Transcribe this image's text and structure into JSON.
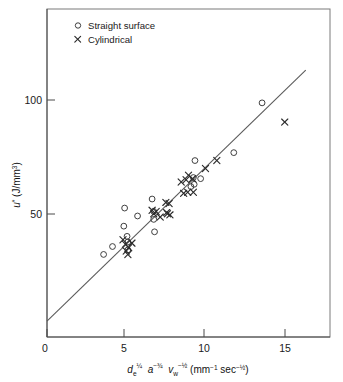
{
  "chart_data": {
    "type": "scatter",
    "title": "",
    "xlabel": "de^1/4 a^-3/4 vw^-1/2 (mm^-1 sec^-1/2)",
    "ylabel": "u* (J/mm3)",
    "xlim": [
      0,
      17.5
    ],
    "ylim": [
      0,
      145
    ],
    "xticks": [
      0,
      5,
      10,
      15
    ],
    "xticklabels": [
      "0",
      "5",
      "10",
      "15"
    ],
    "yticks": [
      50,
      100
    ],
    "yticklabels": [
      "50",
      "100"
    ],
    "grid": false,
    "legend_position": "top-left",
    "series": [
      {
        "name": "Straight surface",
        "marker": "circle",
        "points": [
          [
            3.5,
            36.5
          ],
          [
            4.05,
            40.0
          ],
          [
            4.75,
            49.0
          ],
          [
            4.8,
            57.0
          ],
          [
            4.95,
            44.5
          ],
          [
            5.0,
            42.0
          ],
          [
            5.0,
            38.5
          ],
          [
            5.6,
            53.5
          ],
          [
            6.5,
            61.0
          ],
          [
            6.6,
            55.5
          ],
          [
            6.6,
            52.0
          ],
          [
            6.65,
            46.5
          ],
          [
            8.9,
            66.5
          ],
          [
            9.05,
            70.5
          ],
          [
            9.1,
            67.5
          ],
          [
            9.5,
            70.0
          ],
          [
            9.15,
            78.0
          ],
          [
            11.55,
            81.5
          ],
          [
            13.3,
            103.5
          ]
        ]
      },
      {
        "name": "Cylindrical",
        "marker": "x",
        "points": [
          [
            4.7,
            43.0
          ],
          [
            4.85,
            41.0
          ],
          [
            4.9,
            38.0
          ],
          [
            5.0,
            36.5
          ],
          [
            5.05,
            39.5
          ],
          [
            5.25,
            41.5
          ],
          [
            6.5,
            56.0
          ],
          [
            6.6,
            54.5
          ],
          [
            6.75,
            55.5
          ],
          [
            7.0,
            53.0
          ],
          [
            7.35,
            59.5
          ],
          [
            7.4,
            55.0
          ],
          [
            7.45,
            54.5
          ],
          [
            7.55,
            59.0
          ],
          [
            7.6,
            54.0
          ],
          [
            8.3,
            68.5
          ],
          [
            8.45,
            63.5
          ],
          [
            8.6,
            69.5
          ],
          [
            8.7,
            64.0
          ],
          [
            8.75,
            71.5
          ],
          [
            9.0,
            70.0
          ],
          [
            9.05,
            64.0
          ],
          [
            9.8,
            74.5
          ],
          [
            10.5,
            78.0
          ],
          [
            14.7,
            95.0
          ]
        ]
      }
    ],
    "fit_line": {
      "x": [
        0,
        16.0
      ],
      "y": [
        7.0,
        118.0
      ]
    }
  },
  "legend": {
    "items": [
      {
        "label": "Straight surface",
        "marker": "circle"
      },
      {
        "label": "Cylindrical",
        "marker": "x"
      }
    ]
  },
  "axis_label_parts": {
    "d_symbol": "d",
    "d_subscript": "e",
    "d_exponent": "¼",
    "a_symbol": "a",
    "a_exponent": "−¾",
    "v_symbol": "v",
    "v_subscript": "w",
    "v_exponent": "−½",
    "units_open": "(mm",
    "units_mm_exp": "−1",
    "units_sec": " sec",
    "units_sec_exp": "−½",
    "units_close": ")"
  },
  "ylabel_parts": {
    "u_symbol": "u",
    "u_star": "*",
    "u_units": " (J/mm",
    "u_units_exp": "3",
    "u_units_close": ")"
  }
}
